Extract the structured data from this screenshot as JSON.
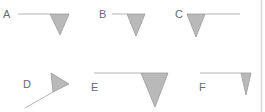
{
  "figure": {
    "colors": {
      "flag_fill": "#b9b9b9",
      "flag_stroke": "#9a9a9a",
      "line": "#b4b4b4",
      "label": "#6a6a6a",
      "border": "#d6d6d6"
    },
    "options": [
      {
        "label": "A"
      },
      {
        "label": "B"
      },
      {
        "label": "C"
      },
      {
        "label": "D"
      },
      {
        "label": "E"
      },
      {
        "label": "F"
      }
    ]
  }
}
